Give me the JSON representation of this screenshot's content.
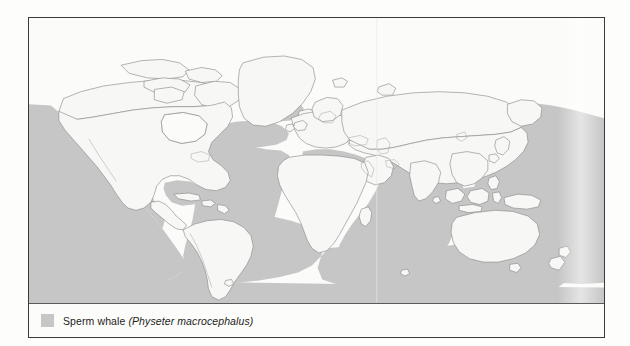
{
  "figure": {
    "type": "species-distribution-map",
    "projection": "equirectangular",
    "colors": {
      "range_fill": "#c6c6c6",
      "land_fill": "#f7f7f5",
      "non_range_ocean": "#fbfbf9",
      "coastline": "#8a8a8a",
      "frame": "#3a3a3a",
      "text": "#1c1c1c"
    }
  },
  "legend": {
    "swatch_color": "#c6c6c6",
    "common_name": "Sperm whale",
    "scientific_name": "(Physeter macrocephalus)",
    "full_label": "Sperm whale (Physeter macrocephalus)"
  },
  "map_data": {
    "type": "choropleth-range-map",
    "title": "",
    "shaded_meaning": "Sperm whale range",
    "range_regions": [
      "Pacific Ocean",
      "Atlantic Ocean",
      "Indian Ocean",
      "Mediterranean Sea",
      "Southern Ocean margins",
      "Sea of Japan",
      "Gulf of Mexico and Caribbean Sea",
      "Coral Sea and Tasman Sea"
    ],
    "excluded_regions": [
      "Arctic Ocean",
      "Hudson Bay",
      "Baltic Sea",
      "North Sea",
      "Black Sea",
      "Persian Gulf",
      "Continental land masses"
    ],
    "landmasses": [
      "North America",
      "South America",
      "Greenland",
      "Europe",
      "Africa",
      "Asia",
      "Australia",
      "Madagascar",
      "New Zealand",
      "Japan",
      "British Isles",
      "Indonesia",
      "New Guinea",
      "Iceland"
    ]
  }
}
